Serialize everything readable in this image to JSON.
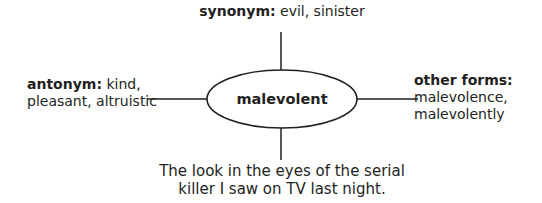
{
  "center": {
    "word": "malevolent"
  },
  "synonym": {
    "heading": "synonym:",
    "text": " evil, sinister"
  },
  "antonym": {
    "heading": "antonym:",
    "text_line1": " kind,",
    "text_line2": "pleasant, altruistic"
  },
  "other_forms": {
    "heading": "other forms:",
    "line1": "malevolence,",
    "line2": "malevolently"
  },
  "example": {
    "line1": "The look in the eyes of the serial",
    "line2": "killer I saw on TV last night."
  },
  "colors": {
    "ink": "#231f20",
    "background": "#ffffff"
  }
}
